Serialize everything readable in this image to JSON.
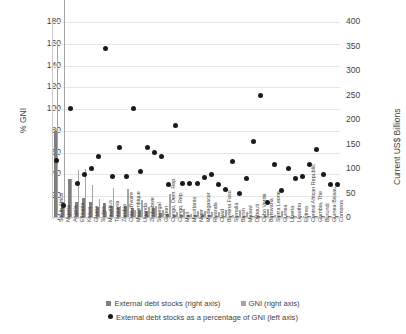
{
  "chart_data": {
    "type": "bar",
    "title": "",
    "xlabel": "",
    "ylabel": "% GNI",
    "ylabel_right": "Current US$ Billions",
    "ylim": [
      0,
      180
    ],
    "ylim_right": [
      0,
      400
    ],
    "yticks": [
      0,
      20,
      40,
      60,
      80,
      100,
      120,
      140,
      160,
      180
    ],
    "yticks_right": [
      0,
      50,
      100,
      150,
      200,
      250,
      300,
      350,
      400
    ],
    "grid": true,
    "legend_position": "bottom",
    "legend": [
      "External debt stocks (right axis)",
      "GNI (right axis)",
      "External debt stocks as a percentage of GNI (left axis)"
    ],
    "categories": [
      "South Africa",
      "Nigeria",
      "Angola",
      "Ethiopia",
      "Kenya",
      "Ghana",
      "Sudan",
      "Mauritius",
      "Tanzania",
      "Zambia",
      "Cote d'Ivoire",
      "Mozambique",
      "Uganda",
      "Zimbabwe",
      "Senegal",
      "Gabon",
      "Congo, Dem. Rep.",
      "Congo, Rep.",
      "Mali",
      "Mauritania",
      "Niger",
      "Madagascar",
      "Rwanda",
      "Chad",
      "Burkina Faso",
      "Somalia",
      "Benin",
      "Malawi",
      "Djibouti",
      "Cabo Verde",
      "Botswana",
      "Sierra Leone",
      "Guinea",
      "Liberia",
      "Lesotho",
      "Eritrea",
      "Central African Republic",
      "Gambia, The",
      "Burundi",
      "Guinea-Bissau",
      "Comoros"
    ],
    "series": [
      {
        "name": "External debt stocks (right axis)",
        "axis": "right",
        "units": "Current US$ Billions",
        "values": [
          175,
          30,
          77,
          30,
          38,
          30,
          21,
          28,
          22,
          21,
          22,
          19,
          15,
          13,
          18,
          8,
          6,
          5,
          5,
          5,
          4,
          4,
          4,
          3,
          3,
          3,
          3,
          3,
          3,
          2,
          2,
          2,
          3,
          1,
          1,
          1,
          1,
          1,
          1,
          1,
          0.3
        ]
      },
      {
        "name": "GNI (right axis)",
        "axis": "right",
        "units": "Current US$ Billions",
        "values": [
          362,
          448,
          77,
          96,
          98,
          66,
          36,
          13,
          59,
          23,
          58,
          14,
          35,
          21,
          23,
          15,
          47,
          11,
          16,
          7,
          13,
          13,
          10,
          10,
          14,
          5,
          14,
          10,
          3,
          2,
          17,
          4,
          13,
          3,
          2,
          2,
          2,
          2,
          3,
          1,
          1
        ]
      },
      {
        "name": "External debt stocks as a percentage of GNI (left axis)",
        "axis": "left",
        "units": "% GNI",
        "values": [
          52,
          11,
          100,
          31,
          39,
          45,
          56,
          155,
          37,
          64,
          37,
          100,
          42,
          64,
          59,
          56,
          30,
          84,
          31,
          31,
          31,
          36,
          39,
          30,
          25,
          51,
          22,
          35,
          69,
          112,
          13,
          48,
          24,
          45,
          35,
          37,
          48,
          62,
          39,
          30,
          30
        ]
      }
    ]
  }
}
